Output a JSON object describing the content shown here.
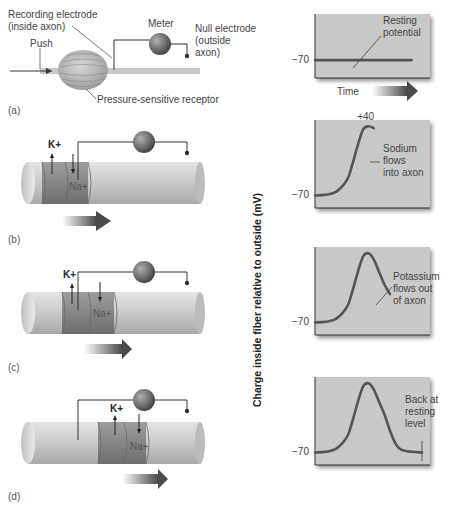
{
  "figure": {
    "panels": [
      {
        "id": "a",
        "label": "(a)",
        "labels": {
          "recording_electrode_line1": "Recording electrode",
          "recording_electrode_line2": "(inside axon)",
          "meter": "Meter",
          "null_electrode_line1": "Null electrode",
          "null_electrode_line2": "(outside",
          "null_electrode_line3": "axon)",
          "push": "Push",
          "receptor": "Pressure-sensitive receptor"
        }
      },
      {
        "id": "b",
        "label": "(b)",
        "k_label": "K+",
        "na_label": "Na+"
      },
      {
        "id": "c",
        "label": "(c)",
        "k_label": "K+",
        "na_label": "Na+"
      },
      {
        "id": "d",
        "label": "(d)",
        "k_label": "K+",
        "na_label": "Na+"
      }
    ],
    "y_axis_label": "Charge inside fiber relative to outside (mV)",
    "time_label": "Time",
    "colors": {
      "chart_bg": "#c9c9c9",
      "curve": "#555555",
      "axon": "#c4c4c4",
      "active_region": "#8f8f8f",
      "meter": "#6b6b6b"
    }
  },
  "chart_data": [
    {
      "type": "line",
      "title": "Resting potential",
      "annotation": "Resting potential",
      "ylabel": "Charge inside fiber relative to outside (mV)",
      "xlabel": "Time",
      "y_tick_labels": [
        "-70"
      ],
      "ylim": [
        -90,
        50
      ],
      "x": [
        0,
        0.2,
        0.4,
        0.6,
        0.8,
        1.0
      ],
      "values": [
        -70,
        -70,
        -70,
        -70,
        -70,
        -70
      ]
    },
    {
      "type": "line",
      "title": "Sodium flows into axon",
      "annotation": "Sodium flows into axon",
      "peak_label": "+40",
      "y_tick_labels": [
        "-70"
      ],
      "ylim": [
        -90,
        50
      ],
      "x": [
        0,
        0.1,
        0.2,
        0.3,
        0.35,
        0.4,
        0.45,
        0.5,
        0.55
      ],
      "values": [
        -70,
        -69,
        -64,
        -45,
        -20,
        10,
        35,
        40,
        37
      ]
    },
    {
      "type": "line",
      "title": "Potassium flows out of axon",
      "annotation": "Potassium flows out of axon",
      "y_tick_labels": [
        "-70"
      ],
      "ylim": [
        -90,
        50
      ],
      "x": [
        0,
        0.1,
        0.2,
        0.3,
        0.35,
        0.4,
        0.45,
        0.5,
        0.55,
        0.6,
        0.65,
        0.7
      ],
      "values": [
        -70,
        -69,
        -64,
        -45,
        -20,
        10,
        35,
        40,
        30,
        10,
        -10,
        -25
      ]
    },
    {
      "type": "line",
      "title": "Back at resting level",
      "annotation": "Back at resting level",
      "y_tick_labels": [
        "-70"
      ],
      "ylim": [
        -90,
        50
      ],
      "x": [
        0,
        0.1,
        0.2,
        0.3,
        0.35,
        0.4,
        0.45,
        0.5,
        0.55,
        0.6,
        0.65,
        0.7,
        0.75,
        0.8,
        0.9,
        1.0
      ],
      "values": [
        -70,
        -69,
        -64,
        -45,
        -20,
        10,
        35,
        40,
        30,
        10,
        -10,
        -35,
        -55,
        -65,
        -69,
        -70
      ]
    }
  ]
}
